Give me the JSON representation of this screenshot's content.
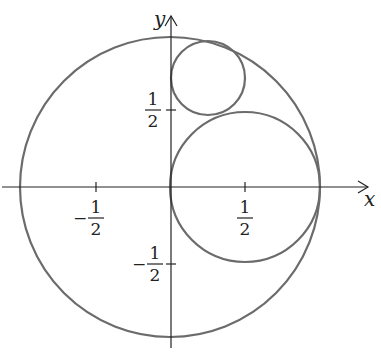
{
  "diagram": {
    "axes": {
      "x_label": "x",
      "y_label": "y"
    },
    "ticks": {
      "x_pos": {
        "num": "1",
        "den": "2"
      },
      "x_neg": {
        "sign": "−",
        "num": "1",
        "den": "2"
      },
      "y_pos": {
        "num": "1",
        "den": "2"
      },
      "y_neg": {
        "sign": "−",
        "num": "1",
        "den": "2"
      }
    },
    "circles": [
      {
        "name": "unit circle",
        "center": [
          0,
          0
        ],
        "radius": 1
      },
      {
        "name": "middle circle",
        "center": [
          0.5,
          0
        ],
        "radius": 0.5
      },
      {
        "name": "small circle",
        "center": [
          0.25,
          0.72
        ],
        "radius": 0.25
      }
    ],
    "colors": {
      "curve": "#6b6b6b",
      "axis": "#222222"
    }
  }
}
